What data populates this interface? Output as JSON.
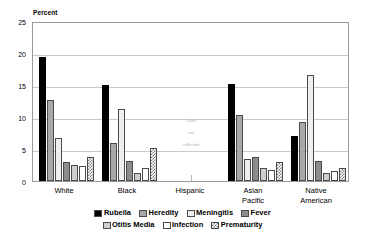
{
  "chart_data": {
    "type": "bar",
    "title": "",
    "subtitle": "",
    "xlabel": "",
    "ylabel": "Percent",
    "ylim": [
      0,
      25
    ],
    "yticks": [
      0,
      5,
      10,
      15,
      20,
      25
    ],
    "grid": true,
    "legend_position": "bottom",
    "categories": [
      "White",
      "Black",
      "Hispanic",
      "Asian Pacific",
      "Native American"
    ],
    "category_lines": [
      [
        "White"
      ],
      [
        "Black"
      ],
      [
        "Hispanic"
      ],
      [
        "Asian",
        "Pacific"
      ],
      [
        "Native",
        "American"
      ]
    ],
    "series": [
      {
        "name": "Rubella",
        "fill": "solid-black",
        "color": "#000000",
        "values": [
          19.4,
          15.0,
          null,
          15.1,
          7.1
        ]
      },
      {
        "name": "Heredity",
        "fill": "gray",
        "color": "#a8a8a8",
        "values": [
          12.7,
          5.9,
          null,
          10.3,
          9.2
        ]
      },
      {
        "name": "Meningitis",
        "fill": "light-gray",
        "color": "#efefef",
        "values": [
          6.7,
          11.3,
          null,
          3.5,
          16.5
        ]
      },
      {
        "name": "Fever",
        "fill": "dark-gray",
        "color": "#8d8d8d",
        "values": [
          2.9,
          3.2,
          null,
          3.7,
          3.2
        ]
      },
      {
        "name": "Otitis Media",
        "fill": "pale-gray",
        "color": "#cfcfcf",
        "values": [
          2.5,
          1.3,
          null,
          2.0,
          1.3
        ]
      },
      {
        "name": "Infection",
        "fill": "white",
        "color": "#ffffff",
        "values": [
          2.4,
          2.0,
          null,
          1.7,
          1.5
        ]
      },
      {
        "name": "Prematurity",
        "fill": "checkered",
        "color": "#7d7d7d",
        "values": [
          3.8,
          5.1,
          null,
          2.9,
          2.1
        ]
      }
    ],
    "annotations": [
      {
        "category": "Hispanic",
        "lines": [
          "Data",
          "not",
          "collected"
        ],
        "text": "Data not collected"
      }
    ]
  }
}
